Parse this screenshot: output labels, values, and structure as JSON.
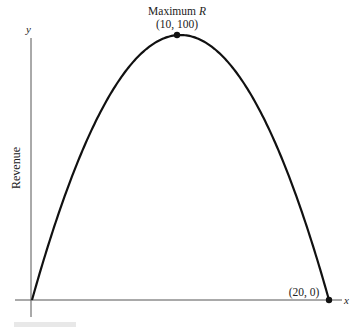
{
  "chart_data": {
    "type": "line",
    "title": "",
    "xlabel": "x",
    "ylabel": "y",
    "y_axis_title": "Revenue",
    "xlim": [
      0,
      20
    ],
    "ylim": [
      0,
      100
    ],
    "grid": false,
    "series": [
      {
        "name": "R",
        "x": [
          0,
          2,
          4,
          6,
          8,
          10,
          12,
          14,
          16,
          18,
          20
        ],
        "values": [
          0,
          36,
          64,
          84,
          96,
          100,
          96,
          84,
          64,
          36,
          0
        ]
      }
    ],
    "annotations": [
      {
        "label_line1": "Maximum ",
        "label_italic": "R",
        "label_line2": "(10, 100)",
        "x": 10,
        "y": 100
      },
      {
        "label": "(20, 0)",
        "x": 20,
        "y": 0
      }
    ]
  },
  "labels": {
    "y_axis": "y",
    "x_axis": "x",
    "revenue": "Revenue",
    "max_title": "Maximum ",
    "max_var": "R",
    "max_point": "(10, 100)",
    "end_point": "(20, 0)"
  },
  "colors": {
    "axis": "#555555",
    "curve": "#111111"
  }
}
